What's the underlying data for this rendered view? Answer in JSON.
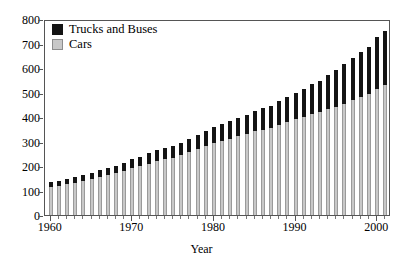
{
  "chart_data": {
    "type": "bar",
    "stacked": true,
    "title": "",
    "subtitle": "",
    "xlabel": "Year",
    "ylabel": "",
    "xlim": [
      1959.3,
      2001.7
    ],
    "ylim": [
      0,
      800
    ],
    "ytick_step": 100,
    "yticks": [
      0,
      100,
      200,
      300,
      400,
      500,
      600,
      700,
      800
    ],
    "xticks_major": [
      1960,
      1970,
      1980,
      1990,
      2000
    ],
    "xtick_labels": [
      "1960",
      "1970",
      "1980",
      "1990",
      "2000"
    ],
    "xticks_minor_every": 1,
    "grid": false,
    "legend_position": "top-left",
    "categories": [
      1960,
      1961,
      1962,
      1963,
      1964,
      1965,
      1966,
      1967,
      1968,
      1969,
      1970,
      1971,
      1972,
      1973,
      1974,
      1975,
      1976,
      1977,
      1978,
      1979,
      1980,
      1981,
      1982,
      1983,
      1984,
      1985,
      1986,
      1987,
      1988,
      1989,
      1990,
      1991,
      1992,
      1993,
      1994,
      1995,
      1996,
      1997,
      1998,
      1999,
      2000,
      2001
    ],
    "series": [
      {
        "name": "Cars",
        "color": "#c8c8c8",
        "values": [
          115,
          118,
          125,
          132,
          140,
          148,
          155,
          162,
          170,
          180,
          193,
          200,
          210,
          222,
          228,
          234,
          245,
          257,
          270,
          282,
          294,
          304,
          312,
          322,
          332,
          341,
          348,
          355,
          366,
          378,
          390,
          400,
          412,
          420,
          432,
          442,
          455,
          468,
          480,
          492,
          515,
          530
        ]
      },
      {
        "name": "Trucks and Buses",
        "color": "#141414",
        "values": [
          18,
          19,
          21,
          22,
          23,
          25,
          27,
          29,
          31,
          33,
          35,
          38,
          42,
          45,
          46,
          47,
          50,
          54,
          58,
          62,
          65,
          67,
          70,
          74,
          78,
          82,
          88,
          92,
          98,
          105,
          110,
          115,
          122,
          128,
          138,
          148,
          160,
          172,
          185,
          195,
          210,
          222
        ]
      }
    ],
    "totals": [
      133,
      137,
      146,
      154,
      163,
      173,
      182,
      191,
      201,
      213,
      228,
      238,
      252,
      267,
      274,
      281,
      295,
      311,
      328,
      344,
      359,
      371,
      382,
      396,
      410,
      423,
      436,
      447,
      464,
      483,
      500,
      515,
      534,
      548,
      570,
      590,
      615,
      640,
      665,
      687,
      725,
      752
    ]
  },
  "axes": {
    "y_tick_labels": [
      "800",
      "700",
      "600",
      "500",
      "400",
      "300",
      "200",
      "100",
      "0"
    ],
    "x_tick_labels": [
      "1960",
      "1970",
      "1980",
      "1990",
      "2000"
    ],
    "x_title": "Year"
  },
  "legend": {
    "items": [
      {
        "label": "Trucks and Buses",
        "swatch": "#141414"
      },
      {
        "label": "Cars",
        "swatch": "#c8c8c8"
      }
    ]
  }
}
